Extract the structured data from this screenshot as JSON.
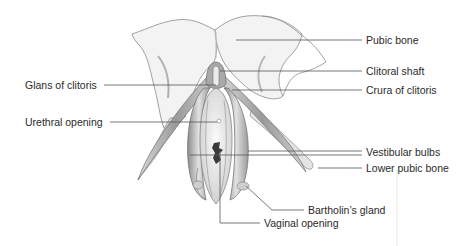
{
  "figure": {
    "type": "anatomical-illustration",
    "colors": {
      "background": "#ffffff",
      "bone_fill": "#f2f2f2",
      "bone_outline": "#8a8a8a",
      "tissue_fill": "#c9c9c9",
      "tissue_dark": "#8f8f8f",
      "vestibule_fill": "#ededed",
      "opening_dark": "#3a3a3a",
      "leader_line": "#555555",
      "label_text": "#2a2a2a"
    },
    "labels": [
      {
        "id": "pubic-bone",
        "text": "Pubic bone",
        "side": "right"
      },
      {
        "id": "clitoral-shaft",
        "text": "Clitoral shaft",
        "side": "right"
      },
      {
        "id": "glans-of-clitoris",
        "text": "Glans of clitoris",
        "side": "left"
      },
      {
        "id": "crura-of-clitoris",
        "text": "Crura of clitoris",
        "side": "right"
      },
      {
        "id": "urethral-opening",
        "text": "Urethral opening",
        "side": "left"
      },
      {
        "id": "vestibular-bulbs",
        "text": "Vestibular bulbs",
        "side": "right"
      },
      {
        "id": "lower-pubic-bone",
        "text": "Lower pubic bone",
        "side": "right"
      },
      {
        "id": "bartholins-gland",
        "text": "Bartholin’s gland",
        "side": "bottom"
      },
      {
        "id": "vaginal-opening",
        "text": "Vaginal opening",
        "side": "bottom"
      }
    ]
  }
}
